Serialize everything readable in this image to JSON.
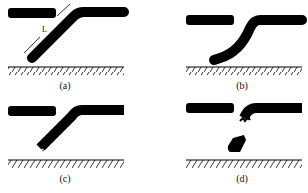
{
  "figure": {
    "panels": [
      {
        "id": "a",
        "caption": "(a)",
        "description": "Bent rod touching ground, dimension L marked along inclined segment",
        "dimension_label": "L"
      },
      {
        "id": "b",
        "caption": "(b)",
        "description": "Rod bending with tip curling along ground"
      },
      {
        "id": "c",
        "caption": "(c)",
        "description": "Rod tip fracturing near ground"
      },
      {
        "id": "d",
        "caption": "(d)",
        "description": "Rod broken, fragment detached above ground"
      }
    ],
    "colors": {
      "ink": "#000000",
      "background": "#ffffff"
    }
  }
}
